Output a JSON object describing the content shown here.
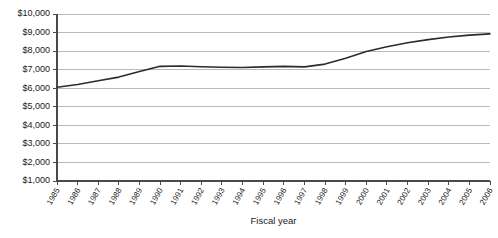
{
  "chart_data": {
    "type": "line",
    "title": "",
    "xlabel": "Fiscal year",
    "ylabel": "",
    "grid": true,
    "legend": false,
    "ylim": [
      1000,
      10000
    ],
    "ytick_values": [
      1000,
      2000,
      3000,
      4000,
      5000,
      6000,
      7000,
      8000,
      9000,
      10000
    ],
    "ytick_labels": [
      "$1,000",
      "$2,000",
      "$3,000",
      "$4,000",
      "$5,000",
      "$6,000",
      "$7,000",
      "$8,000",
      "$9,000",
      "$10,000"
    ],
    "categories": [
      "1985",
      "1986",
      "1987",
      "1988",
      "1989",
      "1990",
      "1991",
      "1992",
      "1993",
      "1994",
      "1995",
      "1996",
      "1997",
      "1998",
      "1999",
      "2000",
      "2001",
      "2002",
      "2003",
      "2004",
      "2005",
      "2006"
    ],
    "values": [
      6050,
      6200,
      6400,
      6600,
      6900,
      7180,
      7200,
      7160,
      7130,
      7120,
      7150,
      7180,
      7150,
      7300,
      7620,
      7980,
      8230,
      8450,
      8620,
      8760,
      8860,
      8930
    ],
    "series": [
      {
        "name": "Expenditure per pupil",
        "color": "#2b2b2b",
        "values": [
          6050,
          6200,
          6400,
          6600,
          6900,
          7180,
          7200,
          7160,
          7130,
          7120,
          7150,
          7180,
          7150,
          7300,
          7620,
          7980,
          8230,
          8450,
          8620,
          8760,
          8860,
          8930
        ]
      }
    ]
  },
  "axes": {
    "x_title": "Fiscal year"
  }
}
